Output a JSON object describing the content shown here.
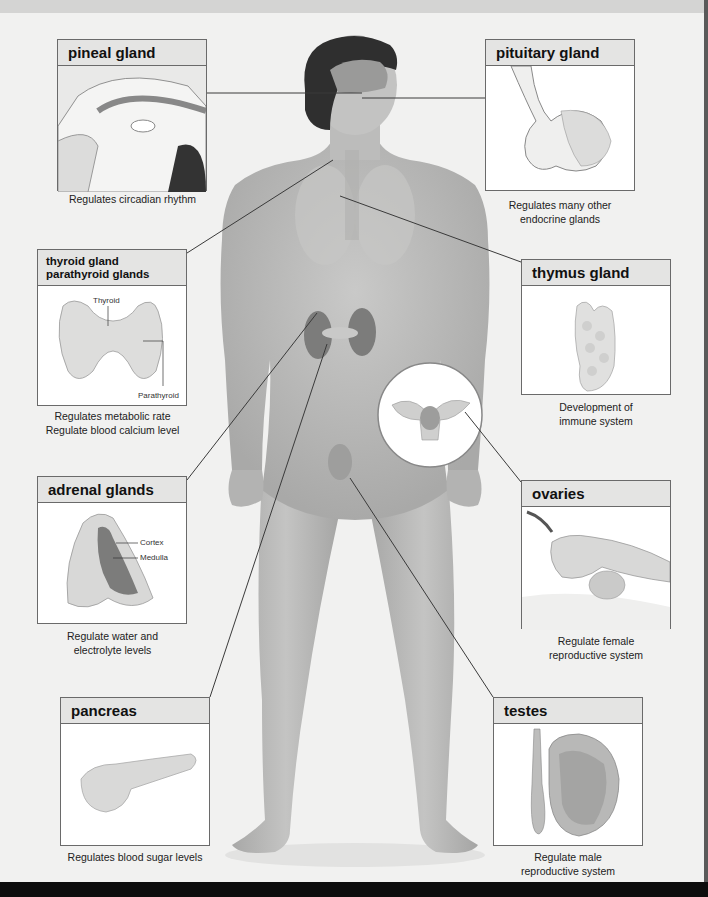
{
  "glands": [
    {
      "id": "pineal",
      "name": "pineal gland",
      "caption": [
        "Regulates circadian rhythm"
      ]
    },
    {
      "id": "pituitary",
      "name": "pituitary gland",
      "caption": [
        "Regulates many other",
        "endocrine glands"
      ]
    },
    {
      "id": "thyroid",
      "name_lines": [
        "thyroid gland",
        "parathyroid glands"
      ],
      "caption": [
        "Regulates metabolic rate",
        "Regulate blood calcium level"
      ],
      "labels": {
        "thyroid": "Thyroid",
        "parathyroid": "Parathyroid"
      }
    },
    {
      "id": "thymus",
      "name": "thymus gland",
      "caption": [
        "Development of",
        "immune system"
      ]
    },
    {
      "id": "adrenal",
      "name": "adrenal glands",
      "caption": [
        "Regulate water and",
        "electrolyte levels"
      ],
      "labels": {
        "cortex": "Cortex",
        "medulla": "Medulla"
      }
    },
    {
      "id": "ovaries",
      "name": "ovaries",
      "caption": [
        "Regulate female",
        "reproductive system"
      ]
    },
    {
      "id": "pancreas",
      "name": "pancreas",
      "caption": [
        "Regulates blood sugar levels"
      ]
    },
    {
      "id": "testes",
      "name": "testes",
      "caption": [
        "Regulate male",
        "reproductive system"
      ]
    }
  ],
  "colors": {
    "background": "#f1f1f0",
    "box_border": "#6a6a6a",
    "header_fill": "#e4e4e3",
    "skin": "#bdbdbc",
    "leader_line": "#3a3a3a"
  }
}
